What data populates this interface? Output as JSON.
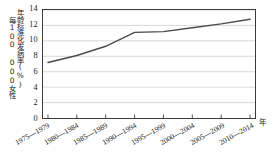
{
  "chart_data": {
    "type": "line",
    "title": "",
    "subtitle": "",
    "xlabel": "年",
    "ylabel_line1": "年龄标准化发病率(%)",
    "ylabel_line2": "每100 000女性",
    "categories": [
      "1975—1979",
      "1980—1984",
      "1985—1989",
      "1990—1994",
      "1995—1999",
      "2000—2004",
      "2005—2009",
      "2010—2014"
    ],
    "values": [
      7.2,
      8.1,
      9.3,
      11.1,
      11.2,
      11.7,
      12.2,
      12.8
    ],
    "series": [
      {
        "name": "年龄标准化发病率",
        "values": [
          7.2,
          8.1,
          9.3,
          11.1,
          11.2,
          11.7,
          12.2,
          12.8
        ]
      }
    ],
    "ylim": [
      0,
      14
    ],
    "yticks": [
      0,
      2,
      4,
      6,
      8,
      10,
      12,
      14
    ],
    "ytick_labels": [
      "0",
      "2",
      "4",
      "6",
      "8",
      "10",
      "12",
      "14"
    ],
    "grid": "horizontal",
    "legend": "none",
    "line_color": "#4a4a4a",
    "grid_color": "#cfcfcf",
    "axis_color": "#3a3a3a",
    "markers": false
  }
}
